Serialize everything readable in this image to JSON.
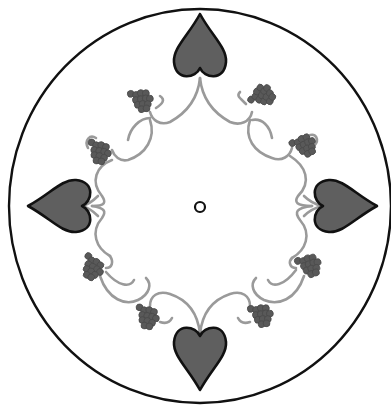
{
  "artwork": {
    "title": "",
    "description": "Circular ornamental motif: four dark hearts at the compass points linked by a grey vine ring with eight grape clusters and a small ring in the center",
    "colors": {
      "background": "#ffffff",
      "outline": "#111111",
      "heart_fill": "#5f5f5f",
      "vine": "#9a9a9a",
      "grape": "#595959"
    },
    "frame": {
      "cx": 200,
      "cy": 206,
      "rx": 191,
      "ry": 197
    },
    "center_ring": {
      "cx": 200,
      "cy": 207,
      "r": 5
    },
    "hearts": [
      {
        "name": "top",
        "cx": 200,
        "cy": 48,
        "rotation": 180
      },
      {
        "name": "right",
        "cx": 343,
        "cy": 206,
        "rotation": 270
      },
      {
        "name": "bottom",
        "cx": 200,
        "cy": 356,
        "rotation": 0
      },
      {
        "name": "left",
        "cx": 62,
        "cy": 206,
        "rotation": 90
      }
    ],
    "grape_clusters": [
      {
        "name": "top-left",
        "cx": 142,
        "cy": 100
      },
      {
        "name": "top-right",
        "cx": 263,
        "cy": 95
      },
      {
        "name": "upper-left",
        "cx": 100,
        "cy": 152
      },
      {
        "name": "upper-right",
        "cx": 305,
        "cy": 145
      },
      {
        "name": "lower-left",
        "cx": 93,
        "cy": 268
      },
      {
        "name": "lower-right",
        "cx": 310,
        "cy": 265
      },
      {
        "name": "bottom-left",
        "cx": 148,
        "cy": 317
      },
      {
        "name": "bottom-right",
        "cx": 262,
        "cy": 315
      }
    ]
  }
}
